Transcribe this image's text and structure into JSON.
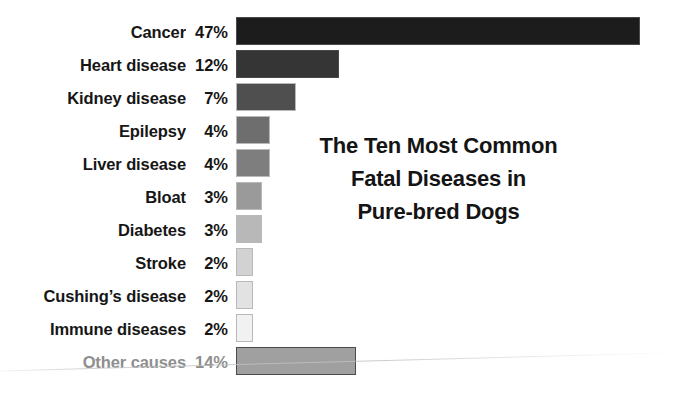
{
  "chart_data": {
    "type": "bar",
    "orientation": "horizontal",
    "title": "The Ten Most Common Fatal Diseases in Pure-bred Dogs",
    "title_lines": [
      "The Ten Most Common",
      "Fatal Diseases in",
      "Pure-bred Dogs"
    ],
    "xlabel": "",
    "ylabel": "",
    "xlim": [
      0,
      47
    ],
    "grid": false,
    "legend": false,
    "value_suffix": "%",
    "px_per_percent": 8.6,
    "categories": [
      "Cancer",
      "Heart disease",
      "Kidney disease",
      "Epilepsy",
      "Liver disease",
      "Bloat",
      "Diabetes",
      "Stroke",
      "Cushing’s disease",
      "Immune diseases",
      "Other causes"
    ],
    "values": [
      47,
      12,
      7,
      4,
      4,
      3,
      3,
      2,
      2,
      2,
      14
    ],
    "value_labels": [
      "47%",
      "12%",
      "7%",
      "4%",
      "4%",
      "3%",
      "3%",
      "2%",
      "2%",
      "2%",
      "14%"
    ],
    "bar_colors": [
      "#1c1c1c",
      "#353535",
      "#4f4f4f",
      "#6e6e6e",
      "#7e7e7e",
      "#9a9a9a",
      "#b8b8b8",
      "#d2d2d2",
      "#e2e2e2",
      "#f1f1f1",
      "#a0a0a0"
    ],
    "rows": [
      {
        "label": "Cancer",
        "value": 47,
        "value_label": "47%",
        "color": "#1c1c1c",
        "muted": false
      },
      {
        "label": "Heart disease",
        "value": 12,
        "value_label": "12%",
        "color": "#353535",
        "muted": false
      },
      {
        "label": "Kidney disease",
        "value": 7,
        "value_label": "7%",
        "color": "#4f4f4f",
        "muted": false
      },
      {
        "label": "Epilepsy",
        "value": 4,
        "value_label": "4%",
        "color": "#6e6e6e",
        "muted": false
      },
      {
        "label": "Liver disease",
        "value": 4,
        "value_label": "4%",
        "color": "#7e7e7e",
        "muted": false
      },
      {
        "label": "Bloat",
        "value": 3,
        "value_label": "3%",
        "color": "#9a9a9a",
        "muted": false
      },
      {
        "label": "Diabetes",
        "value": 3,
        "value_label": "3%",
        "color": "#b8b8b8",
        "muted": false
      },
      {
        "label": "Stroke",
        "value": 2,
        "value_label": "2%",
        "color": "#d2d2d2",
        "muted": false
      },
      {
        "label": "Cushing’s disease",
        "value": 2,
        "value_label": "2%",
        "color": "#e2e2e2",
        "muted": false
      },
      {
        "label": "Immune diseases",
        "value": 2,
        "value_label": "2%",
        "color": "#f1f1f1",
        "muted": false
      },
      {
        "label": "Other causes",
        "value": 14,
        "value_label": "14%",
        "color": "#a0a0a0",
        "muted": true
      }
    ],
    "colors": {
      "background": "#ffffff",
      "label_text": "#161616",
      "muted_text": "#8e8e8e",
      "title_text": "#141414",
      "bar_outline": "#b9b9b9"
    }
  }
}
